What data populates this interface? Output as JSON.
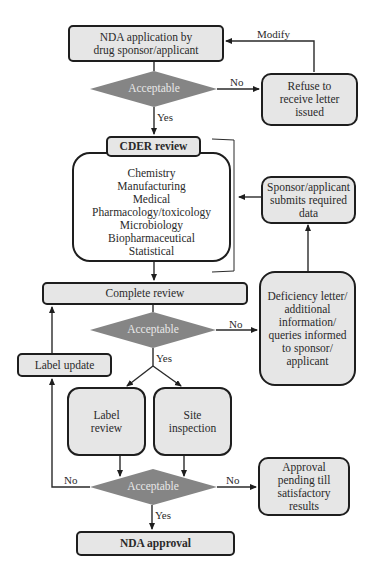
{
  "diagram": {
    "type": "flowchart",
    "nodes": {
      "nda_application": "NDA application by drug sponsor/applicant",
      "decision_1": "Acceptable",
      "refuse_letter": "Refuse to receive letter issued",
      "cder_review_title": "CDER review",
      "cder_review_items": [
        "Chemistry",
        "Manufacturing",
        "Medical",
        "Pharmacology/toxicology",
        "Microbiology",
        "Biopharmaceutical",
        "Statistical"
      ],
      "sponsor_submits": "Sponsor/applicant submits required data",
      "complete_review": "Complete review",
      "decision_2": "Acceptable",
      "deficiency_letter": "Deficiency letter/ additional information/ queries informed to sponsor/ applicant",
      "label_update": "Label update",
      "label_review": "Label review",
      "site_inspection": "Site inspection",
      "decision_3": "Acceptable",
      "approval_pending": "Approval pending till satisfactory results",
      "nda_approval": "NDA approval"
    },
    "edge_labels": {
      "modify": "Modify",
      "d1_no": "No",
      "d1_yes": "Yes",
      "d2_no": "No",
      "d2_yes": "Yes",
      "d3_no_left": "No",
      "d3_no_right": "No",
      "d3_yes": "Yes"
    },
    "colors": {
      "box_fill": "#e6e6e6",
      "border": "#1e1e1e",
      "diamond_fill": "#858585",
      "diamond_text": "#e8e8e8"
    }
  }
}
